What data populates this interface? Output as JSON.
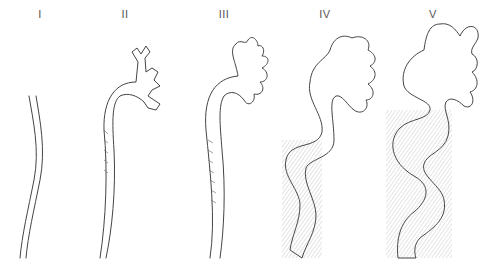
{
  "figure": {
    "type": "diagram",
    "stages": [
      {
        "label": "I",
        "x": 40
      },
      {
        "label": "II",
        "x": 125
      },
      {
        "label": "III",
        "x": 224
      },
      {
        "label": "IV",
        "x": 325
      },
      {
        "label": "V",
        "x": 433
      }
    ]
  },
  "colors": {
    "background": "#ffffff",
    "stroke": "#444444",
    "label": "#555555"
  }
}
